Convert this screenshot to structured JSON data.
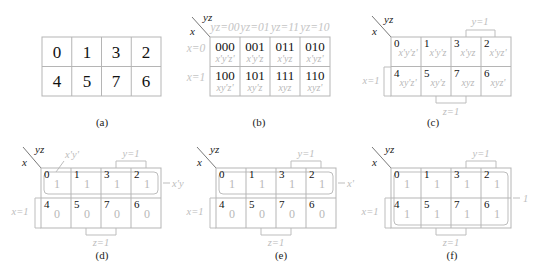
{
  "figure": {
    "panels": [
      {
        "id": "a",
        "caption": "(a)",
        "cells": [
          [
            "0",
            "1",
            "3",
            "2"
          ],
          [
            "4",
            "5",
            "7",
            "6"
          ]
        ]
      },
      {
        "id": "b",
        "caption": "(b)",
        "row_var": "x",
        "col_var": "yz",
        "col_headers": [
          "yz=00",
          "yz=01",
          "yz=11",
          "yz=10"
        ],
        "row_headers": [
          "x=0",
          "x=1"
        ],
        "cells": [
          [
            {
              "bin": "000",
              "term": "x'y'z'"
            },
            {
              "bin": "001",
              "term": "x'y'z"
            },
            {
              "bin": "011",
              "term": "x'yz"
            },
            {
              "bin": "010",
              "term": "x'yz'"
            }
          ],
          [
            {
              "bin": "100",
              "term": "xy'z'"
            },
            {
              "bin": "101",
              "term": "xy'z"
            },
            {
              "bin": "111",
              "term": "xyz"
            },
            {
              "bin": "110",
              "term": "xyz'"
            }
          ]
        ]
      },
      {
        "id": "c",
        "caption": "(c)",
        "row_var": "x",
        "col_var": "yz",
        "brackets": {
          "top": "y=1",
          "left": "x=1",
          "bottom": "z=1"
        },
        "cells": [
          [
            {
              "idx": "0",
              "term": "x'y'z'"
            },
            {
              "idx": "1",
              "term": "x'y'z"
            },
            {
              "idx": "3",
              "term": "x'yz"
            },
            {
              "idx": "2",
              "term": "x'yz'"
            }
          ],
          [
            {
              "idx": "4",
              "term": "xy'z'"
            },
            {
              "idx": "5",
              "term": "xy'z"
            },
            {
              "idx": "7",
              "term": "xyz"
            },
            {
              "idx": "6",
              "term": "xyz'"
            }
          ]
        ]
      },
      {
        "id": "d",
        "caption": "(d)",
        "row_var": "x",
        "col_var": "yz",
        "brackets": {
          "top": "y=1",
          "left": "x=1",
          "bottom": "z=1"
        },
        "group_label_top": "x'y'",
        "result": "x'y",
        "cells": [
          [
            {
              "idx": "0",
              "val": "1"
            },
            {
              "idx": "1",
              "val": "1"
            },
            {
              "idx": "3",
              "val": "1"
            },
            {
              "idx": "2",
              "val": "1"
            }
          ],
          [
            {
              "idx": "4",
              "val": "0"
            },
            {
              "idx": "5",
              "val": "0"
            },
            {
              "idx": "7",
              "val": "0"
            },
            {
              "idx": "6",
              "val": "0"
            }
          ]
        ]
      },
      {
        "id": "e",
        "caption": "(e)",
        "row_var": "x",
        "col_var": "yz",
        "brackets": {
          "top": "y=1",
          "left": "x=1",
          "bottom": "z=1"
        },
        "result": "x'",
        "cells": [
          [
            {
              "idx": "0",
              "val": "1"
            },
            {
              "idx": "1",
              "val": "1"
            },
            {
              "idx": "3",
              "val": "1"
            },
            {
              "idx": "2",
              "val": "1"
            }
          ],
          [
            {
              "idx": "4",
              "val": "0"
            },
            {
              "idx": "5",
              "val": "0"
            },
            {
              "idx": "7",
              "val": "0"
            },
            {
              "idx": "6",
              "val": "0"
            }
          ]
        ]
      },
      {
        "id": "f",
        "caption": "(f)",
        "row_var": "x",
        "col_var": "yz",
        "brackets": {
          "top": "y=1",
          "left": "x=1",
          "bottom": "z=1"
        },
        "result": "1",
        "cells": [
          [
            {
              "idx": "0",
              "val": "1"
            },
            {
              "idx": "1",
              "val": "1"
            },
            {
              "idx": "3",
              "val": "1"
            },
            {
              "idx": "2",
              "val": "1"
            }
          ],
          [
            {
              "idx": "4",
              "val": "1"
            },
            {
              "idx": "5",
              "val": "1"
            },
            {
              "idx": "7",
              "val": "1"
            },
            {
              "idx": "6",
              "val": "1"
            }
          ]
        ]
      }
    ]
  }
}
